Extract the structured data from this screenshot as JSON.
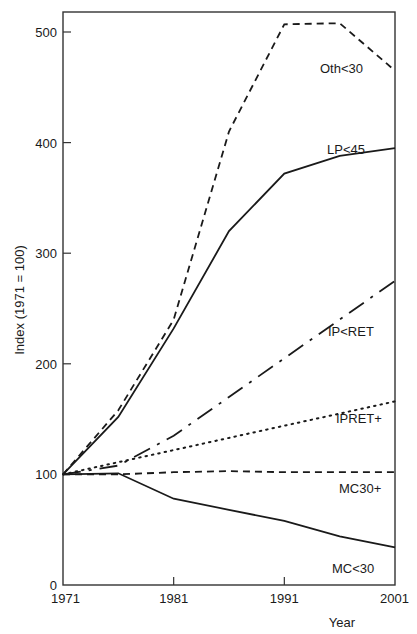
{
  "chart_data": {
    "type": "line",
    "title": "",
    "xlabel": "Year",
    "ylabel": "Index (1971 = 100)",
    "x": [
      1971,
      1976,
      1981,
      1986,
      1991,
      1996,
      2001
    ],
    "x_ticks": [
      "1971",
      "1981",
      "1991",
      "2001"
    ],
    "y_ticks": [
      "0",
      "100",
      "200",
      "300",
      "400",
      "500"
    ],
    "xlim": [
      1971,
      2001
    ],
    "ylim": [
      0,
      520
    ],
    "grid": false,
    "legend_position": "inline labels near line ends",
    "series": [
      {
        "name": "Oth<30",
        "style": "dashed",
        "values": [
          100,
          158,
          240,
          410,
          507,
          508,
          465
        ]
      },
      {
        "name": "LP<45",
        "style": "solid",
        "values": [
          100,
          152,
          232,
          320,
          372,
          388,
          395
        ]
      },
      {
        "name": "IP<RET",
        "style": "dash-dot",
        "values": [
          100,
          108,
          135,
          170,
          205,
          240,
          275
        ]
      },
      {
        "name": "IPRET+",
        "style": "dotted",
        "values": [
          100,
          111,
          122,
          133,
          144,
          155,
          166
        ]
      },
      {
        "name": "MC30+",
        "style": "dashed",
        "values": [
          100,
          100,
          102,
          103,
          102,
          102,
          102
        ]
      },
      {
        "name": "MC<30",
        "style": "solid",
        "values": [
          100,
          101,
          78,
          68,
          58,
          44,
          34
        ]
      }
    ]
  },
  "labels": {
    "xlabel": "Year",
    "ylabel": "Index (1971 = 100)",
    "series": [
      "Oth<30",
      "LP<45",
      "IP<RET",
      "IPRET+",
      "MC30+",
      "MC<30"
    ]
  }
}
